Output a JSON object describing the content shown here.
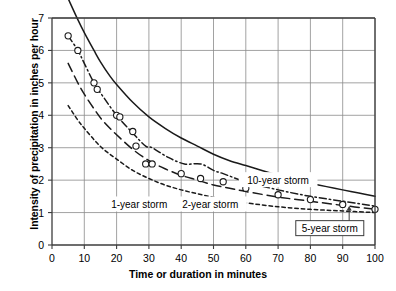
{
  "chart_data": {
    "type": "line",
    "title": "",
    "xlabel": "Time or duration in minutes",
    "ylabel": "Intensity of precipitation in inches per hour",
    "xlim": [
      0,
      100
    ],
    "ylim": [
      0,
      7
    ],
    "xticks": [
      "0",
      "10",
      "20",
      "30",
      "40",
      "50",
      "60",
      "70",
      "80",
      "90",
      "100"
    ],
    "yticks": [
      "0",
      "1",
      "2",
      "3",
      "4",
      "5",
      "6",
      "7"
    ],
    "grid": true,
    "legend_position": "inline-annotations",
    "series": [
      {
        "name": "10-year storm",
        "style": "solid",
        "color": "#1a1a1a",
        "x": [
          5,
          8,
          10,
          13,
          15,
          18,
          20,
          25,
          30,
          35,
          40,
          45,
          50,
          55,
          60,
          65,
          70,
          75,
          80,
          85,
          90,
          95,
          100
        ],
        "y": [
          7.6,
          6.95,
          6.55,
          6.0,
          5.65,
          5.2,
          4.95,
          4.4,
          3.95,
          3.6,
          3.3,
          3.05,
          2.8,
          2.6,
          2.45,
          2.3,
          2.15,
          2.0,
          1.9,
          1.8,
          1.7,
          1.6,
          1.5
        ]
      },
      {
        "name": "5-year storm",
        "style": "dashdot",
        "color": "#1a1a1a",
        "x": [
          5,
          8,
          10,
          13,
          16,
          20,
          25,
          29,
          31,
          36,
          41,
          46,
          50,
          53,
          60,
          70,
          80,
          90,
          100
        ],
        "y": [
          6.45,
          6.0,
          5.6,
          5.0,
          4.55,
          4.0,
          3.45,
          3.05,
          3.0,
          2.7,
          2.5,
          2.5,
          2.3,
          2.2,
          1.95,
          1.7,
          1.5,
          1.35,
          1.2
        ],
        "markers": true,
        "marker_points": [
          {
            "x": 5,
            "y": 6.45
          },
          {
            "x": 8,
            "y": 6.0
          },
          {
            "x": 13,
            "y": 5.0
          },
          {
            "x": 14,
            "y": 4.8
          },
          {
            "x": 20,
            "y": 4.0
          },
          {
            "x": 21,
            "y": 3.95
          },
          {
            "x": 25,
            "y": 3.5
          },
          {
            "x": 26,
            "y": 3.05
          },
          {
            "x": 29,
            "y": 2.5
          },
          {
            "x": 31,
            "y": 2.5
          },
          {
            "x": 40,
            "y": 2.2
          },
          {
            "x": 46,
            "y": 2.05
          },
          {
            "x": 53,
            "y": 1.95
          },
          {
            "x": 60,
            "y": 1.75
          },
          {
            "x": 70,
            "y": 1.55
          },
          {
            "x": 80,
            "y": 1.4
          },
          {
            "x": 90,
            "y": 1.25
          },
          {
            "x": 100,
            "y": 1.1
          }
        ]
      },
      {
        "name": "2-year storm",
        "style": "longdash",
        "color": "#1a1a1a",
        "x": [
          5,
          8,
          10,
          13,
          16,
          20,
          25,
          30,
          35,
          40,
          45,
          50,
          55,
          60,
          70,
          80,
          90,
          100
        ],
        "y": [
          5.6,
          5.0,
          4.65,
          4.2,
          3.8,
          3.4,
          2.95,
          2.6,
          2.35,
          2.15,
          2.0,
          1.85,
          1.75,
          1.65,
          1.48,
          1.35,
          1.22,
          1.1
        ]
      },
      {
        "name": "1-year storm",
        "style": "shortdash",
        "color": "#1a1a1a",
        "x": [
          5,
          8,
          10,
          13,
          16,
          20,
          25,
          30,
          35,
          40,
          45,
          50,
          55,
          60,
          70,
          80,
          90,
          100
        ],
        "y": [
          4.3,
          3.85,
          3.6,
          3.25,
          2.95,
          2.65,
          2.3,
          2.05,
          1.85,
          1.7,
          1.58,
          1.47,
          1.38,
          1.3,
          1.18,
          1.1,
          1.05,
          1.0
        ]
      }
    ],
    "annotations": [
      {
        "id": "ann-10year",
        "text": "10-year storm",
        "x": 70,
        "y": 2.0,
        "boxed": false
      },
      {
        "id": "ann-2year",
        "text": "2-year storm",
        "x": 49,
        "y": 1.25,
        "boxed": false
      },
      {
        "id": "ann-1year",
        "text": "1-year storm",
        "x": 27,
        "y": 1.25,
        "boxed": false
      },
      {
        "id": "ann-5year",
        "text": "5-year storm",
        "x": 86,
        "y": 0.52,
        "boxed": true,
        "arrow_to_x": 92,
        "arrow_to_y": 1.25
      }
    ]
  },
  "colors": {
    "axis": "#3c3c3c",
    "grid": "#8a8a8a",
    "curve": "#1a1a1a",
    "marker_stroke": "#1a1a1a",
    "marker_fill": "#ffffff",
    "background": "#ffffff"
  }
}
